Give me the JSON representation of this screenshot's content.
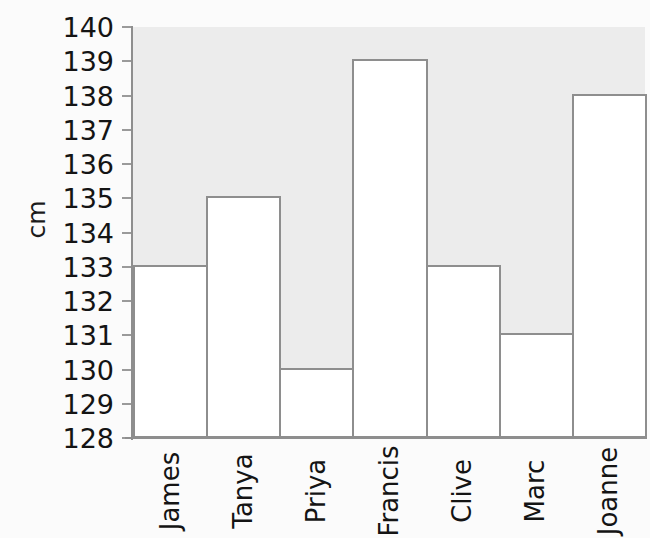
{
  "chart_data": {
    "type": "bar",
    "title": "",
    "subtitle": "",
    "xlabel": "",
    "ylabel": "cm",
    "categories": [
      "James",
      "Tanya",
      "Priya",
      "Francis",
      "Clive",
      "Marc",
      "Joanne"
    ],
    "values": [
      133,
      135,
      130,
      139,
      133,
      131,
      138
    ],
    "series": [
      {
        "name": "Height",
        "values": [
          133,
          135,
          130,
          139,
          133,
          131,
          138
        ]
      }
    ],
    "ylim": [
      128,
      140
    ],
    "ytick_labels": [
      "128",
      "129",
      "130",
      "131",
      "132",
      "133",
      "134",
      "135",
      "136",
      "137",
      "138",
      "139",
      "140"
    ],
    "ytick_values": [
      128,
      129,
      130,
      131,
      132,
      133,
      134,
      135,
      136,
      137,
      138,
      139,
      140
    ],
    "ytick_step": 1,
    "grid": false,
    "legend": false,
    "legend_position": "none",
    "annotations": [],
    "bars_contiguous": true,
    "x_tick_label_rotation": -90,
    "ylabel_rotation": -90,
    "colors": {
      "page_background": "#fbfbfb",
      "plot_background": "#ececec",
      "bar_fill": "#ffffff",
      "bar_stroke": "#8e8e8e",
      "axis_line": "#8e8e8e",
      "tick_mark": "#9a9a9a",
      "text": "#141414"
    }
  },
  "axis": {
    "y_title": "cm"
  }
}
